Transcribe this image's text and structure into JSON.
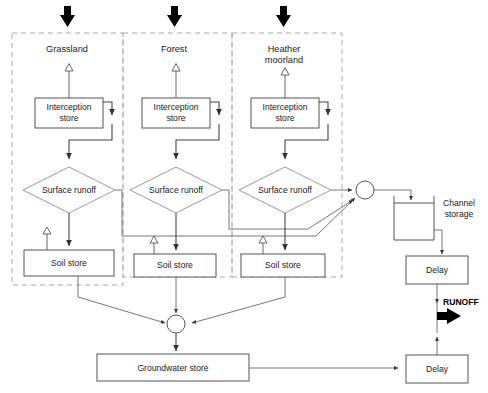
{
  "diagram": {
    "type": "flowchart",
    "colors": {
      "background": "#ffffff",
      "box_stroke": "#555555",
      "dashed_group_stroke": "#aaaaaa",
      "flow_line": "#444444",
      "precipitation_arrow": "#000000",
      "runoff_arrow": "#000000",
      "text": "#222222"
    }
  },
  "land_use_columns": [
    {
      "id": "grassland",
      "label": "Grassland"
    },
    {
      "id": "forest",
      "label": "Forest"
    },
    {
      "id": "heather",
      "label": "Heather\nmoorland",
      "line1": "Heather",
      "line2": "moorland"
    }
  ],
  "stores": {
    "interception_label_line1": "Interception",
    "interception_label_line2": "store",
    "surface_runoff_label": "Surface runoff",
    "soil_label": "Soil store",
    "groundwater_label": "Groundwater store",
    "channel_label_line1": "Channel",
    "channel_label_line2": "storage",
    "delay_label": "Delay"
  },
  "nodes": [
    {
      "name": "interception-store-grassland",
      "label": "Interception store",
      "column": "grassland"
    },
    {
      "name": "interception-store-forest",
      "label": "Interception store",
      "column": "forest"
    },
    {
      "name": "interception-store-heather",
      "label": "Interception store",
      "column": "heather"
    },
    {
      "name": "surface-runoff-grassland",
      "label": "Surface runoff",
      "column": "grassland"
    },
    {
      "name": "surface-runoff-forest",
      "label": "Surface runoff",
      "column": "forest"
    },
    {
      "name": "surface-runoff-heather",
      "label": "Surface runoff",
      "column": "heather"
    },
    {
      "name": "soil-store-grassland",
      "label": "Soil store",
      "column": "grassland"
    },
    {
      "name": "soil-store-forest",
      "label": "Soil store",
      "column": "forest"
    },
    {
      "name": "soil-store-heather",
      "label": "Soil store",
      "column": "heather"
    },
    {
      "name": "groundwater-store",
      "label": "Groundwater store",
      "column": "shared"
    },
    {
      "name": "channel-storage",
      "label": "Channel storage",
      "column": "shared"
    },
    {
      "name": "delay-channel",
      "label": "Delay",
      "column": "shared"
    },
    {
      "name": "delay-groundwater",
      "label": "Delay",
      "column": "shared"
    }
  ],
  "outputs": {
    "runoff_label": "RUNOFF"
  },
  "inputs": {
    "precipitation_arrow_count": 3,
    "precipitation_icon": "down-arrow-icon"
  },
  "evaporation": {
    "icon": "up-arrow-outline-icon",
    "count": 6
  }
}
